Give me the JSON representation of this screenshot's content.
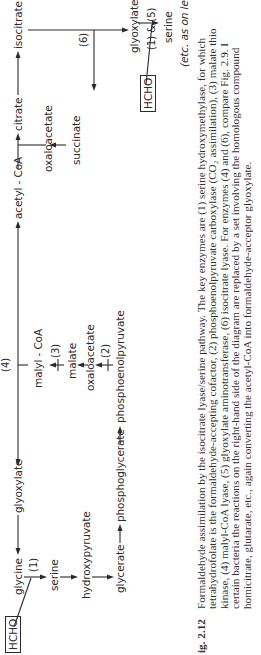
{
  "figure": {
    "label": "Fig. 2.12",
    "label_visible": "ig. 2.12",
    "caption_lines": [
      "Formaldehyde assimilation by the isocitrate lyase/serine pathway. The key enzymes are (1) serine hydroxymethylase, for which",
      "tetrahydrofolate is the formaldehyde-accepting cofactor, (2) phosphoenolpyruvate carboxylase (CO₂ assimilation), (3) malate thio",
      "kinase, (4) malyl-CoA lyase, (5) glyoxylate aminotransferase, (6) isocitrate lyase. For enzymes (4) and (6), compare Fig. 2.9. I",
      "certain bacteria the reactions on the right-hand side of the diagram are replaced by a set involving the homologous compound",
      "homicitrate, glutarate, etc., again converting the acetyl-CoA into formaldehyde-acceptor glyoxylate."
    ]
  },
  "diagram": {
    "compounds": {
      "hcho_left": "HCHO",
      "glycine": "glycine",
      "glyoxylate_left": "glyoxylate",
      "serine_left": "serine",
      "hydroxypyruvate": "hydroxypyruvate",
      "glycerate": "glycerate",
      "phosphoglycerate": "phosphoglycerate",
      "phosphoenolpyruvate": "phosphoenolpyruvate",
      "oxaloacetate_left": "oxaloacetate",
      "malate": "malate",
      "malyl_coa": "malyl - CoA",
      "acetyl_coa": "acetyl - CoA",
      "citrate": "citrate",
      "isocitrate": "isocitrate",
      "oxaloacetate_right": "oxaloacetate",
      "succinate": "succinate",
      "glyoxylate_right": "glyoxylate",
      "serine_right": "serine",
      "hcho_right": "HCHO"
    },
    "enzymes": {
      "e1_left": "(1)",
      "e2": "(2)",
      "e3": "(3)",
      "e4": "(4)",
      "e6": "(6)",
      "e1_5_right": "(1) & (5)"
    },
    "note": "(etc. as on left)"
  }
}
